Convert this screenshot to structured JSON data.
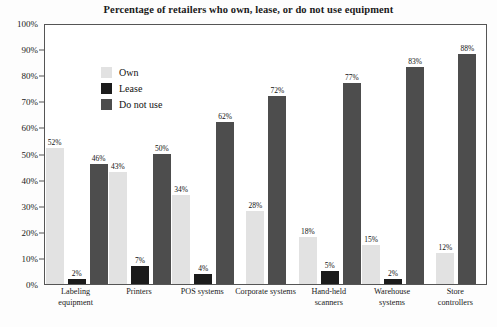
{
  "chart_data": {
    "type": "bar",
    "title": "Percentage of retailers who own, lease, or do not use equipment",
    "xlabel": "",
    "ylabel": "",
    "ylim": [
      0,
      100
    ],
    "grid": false,
    "legend_position": "top-left",
    "y_ticks": [
      "0%",
      "10%",
      "20%",
      "30%",
      "40%",
      "50%",
      "60%",
      "70%",
      "80%",
      "90%",
      "100%"
    ],
    "y_tick_values": [
      0,
      10,
      20,
      30,
      40,
      50,
      60,
      70,
      80,
      90,
      100
    ],
    "categories": [
      "Labeling\nequipment",
      "Printers",
      "POS systems",
      "Corporate systems",
      "Hand-held\nscanners",
      "Warehouse\nsystems",
      "Store controllers"
    ],
    "series": [
      {
        "name": "Own",
        "color": "#e2e2e2",
        "values": [
          52,
          43,
          34,
          28,
          18,
          15,
          12
        ],
        "labels": [
          "52%",
          "43%",
          "34%",
          "28%",
          "18%",
          "15%",
          "12%"
        ]
      },
      {
        "name": "Lease",
        "color": "#1b1b1b",
        "values": [
          2,
          7,
          4,
          0,
          5,
          2,
          0
        ],
        "labels": [
          "2%",
          "7%",
          "4%",
          "",
          "5%",
          "2%",
          ""
        ]
      },
      {
        "name": "Do not use",
        "color": "#4d4d4d",
        "values": [
          46,
          50,
          62,
          72,
          77,
          83,
          88
        ],
        "labels": [
          "46%",
          "50%",
          "62%",
          "72%",
          "77%",
          "83%",
          "88%"
        ]
      }
    ]
  },
  "legend": {
    "items": [
      {
        "label": "Own",
        "color": "#e2e2e2"
      },
      {
        "label": "Lease",
        "color": "#1b1b1b"
      },
      {
        "label": "Do not use",
        "color": "#4d4d4d"
      }
    ]
  }
}
